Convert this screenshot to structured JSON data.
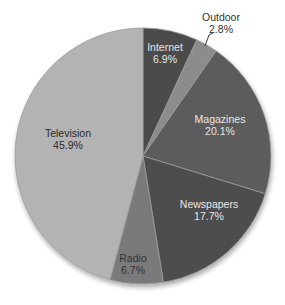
{
  "chart_data": {
    "type": "pie",
    "title": "",
    "categories": [
      "Internet",
      "Outdoor",
      "Magazines",
      "Newspapers",
      "Radio",
      "Television"
    ],
    "values": [
      6.9,
      2.8,
      20.1,
      17.7,
      6.7,
      45.9
    ],
    "unit": "%",
    "start_angle": "12 o'clock, clockwise",
    "legend": "none (data labels on slices)",
    "slices": [
      {
        "label": "Internet",
        "value": 6.9,
        "text": "6.9%",
        "color": "#4b4b4b",
        "label_color": "#e6e6e6",
        "lx": 165,
        "ly": 51,
        "outside": false
      },
      {
        "label": "Outdoor",
        "value": 2.8,
        "text": "2.8%",
        "color": "#8c8c8c",
        "label_color": "#333333",
        "lx": 221,
        "ly": 21,
        "outside": true
      },
      {
        "label": "Magazines",
        "value": 20.1,
        "text": "20.1%",
        "color": "#5c5c5c",
        "label_color": "#e6e6e6",
        "lx": 220,
        "ly": 123,
        "outside": false
      },
      {
        "label": "Newspapers",
        "value": 17.7,
        "text": "17.7%",
        "color": "#4e4e4e",
        "label_color": "#e6e6e6",
        "lx": 209,
        "ly": 208,
        "outside": false
      },
      {
        "label": "Radio",
        "value": 6.7,
        "text": "6.7%",
        "color": "#7a7a7a",
        "label_color": "#333333",
        "lx": 133,
        "ly": 262,
        "outside": false
      },
      {
        "label": "Television",
        "value": 45.9,
        "text": "45.9%",
        "color": "#b3b3b3",
        "label_color": "#2a2a2a",
        "lx": 68,
        "ly": 137,
        "outside": false
      }
    ],
    "outside_leader": {
      "x1": 213,
      "y1": 33,
      "x2": 205,
      "y2": 46
    }
  }
}
